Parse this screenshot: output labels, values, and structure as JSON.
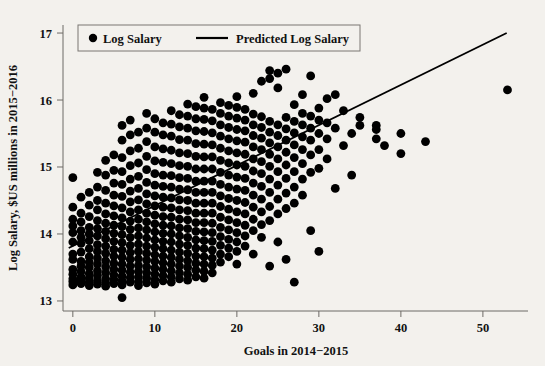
{
  "chart_data": {
    "type": "scatter",
    "title": "",
    "xlabel": "Goals in 2014−2015",
    "ylabel": "Log Salary, $US millions in 2015−2016",
    "xlim": [
      -1.2,
      55.5
    ],
    "ylim": [
      12.85,
      17.12
    ],
    "xticks": [
      0,
      10,
      20,
      30,
      40,
      50
    ],
    "xtick_labels": [
      "0",
      "10",
      "20",
      "30",
      "40",
      "50"
    ],
    "yticks": [
      13,
      14,
      15,
      16,
      17
    ],
    "ytick_labels": [
      "13",
      "14",
      "15",
      "16",
      "17"
    ],
    "grid": false,
    "legend_position": "top-left",
    "series": [
      {
        "name": "Log Salary",
        "type": "scatter",
        "marker": "circle",
        "color": "#000000",
        "marker_size": 4.4,
        "columns": [
          {
            "x": 0,
            "y": [
              13.24,
              13.29,
              13.33,
              13.4,
              13.47,
              13.62,
              13.7,
              13.88,
              14.02,
              14.12,
              14.22,
              14.4,
              14.84
            ]
          },
          {
            "x": 1,
            "y": [
              13.26,
              13.31,
              13.36,
              13.44,
              13.52,
              13.59,
              13.73,
              13.86,
              13.95,
              14.05,
              14.18,
              14.31,
              14.55
            ]
          },
          {
            "x": 2,
            "y": [
              13.23,
              13.28,
              13.34,
              13.41,
              13.5,
              13.58,
              13.66,
              13.78,
              13.9,
              14.0,
              14.1,
              14.26,
              14.43,
              14.62
            ]
          },
          {
            "x": 3,
            "y": [
              13.25,
              13.3,
              13.38,
              13.45,
              13.55,
              13.64,
              13.74,
              13.84,
              13.97,
              14.08,
              14.2,
              14.36,
              14.5,
              14.7,
              14.92
            ]
          },
          {
            "x": 4,
            "y": [
              13.22,
              13.27,
              13.33,
              13.42,
              13.51,
              13.6,
              13.71,
              13.82,
              13.93,
              14.04,
              14.16,
              14.3,
              14.46,
              14.65,
              14.88,
              15.1
            ]
          },
          {
            "x": 5,
            "y": [
              13.26,
              13.32,
              13.39,
              13.47,
              13.56,
              13.67,
              13.77,
              13.89,
              14.01,
              14.13,
              14.27,
              14.42,
              14.58,
              14.76,
              14.95,
              15.18
            ]
          },
          {
            "x": 6,
            "y": [
              13.05,
              13.24,
              13.3,
              13.37,
              13.46,
              13.55,
              13.65,
              13.76,
              13.87,
              13.99,
              14.11,
              14.24,
              14.39,
              14.56,
              14.74,
              14.93,
              15.14,
              15.4,
              15.62
            ]
          },
          {
            "x": 7,
            "y": [
              13.28,
              13.35,
              13.43,
              13.52,
              13.62,
              13.72,
              13.83,
              13.95,
              14.07,
              14.19,
              14.33,
              14.48,
              14.64,
              14.82,
              15.02,
              15.24,
              15.48,
              15.7
            ]
          },
          {
            "x": 8,
            "y": [
              13.23,
              13.29,
              13.36,
              13.44,
              13.53,
              13.63,
              13.74,
              13.85,
              13.97,
              14.09,
              14.22,
              14.36,
              14.51,
              14.68,
              14.86,
              15.06,
              15.28,
              15.52
            ]
          },
          {
            "x": 9,
            "y": [
              13.27,
              13.34,
              13.42,
              13.51,
              13.61,
              13.71,
              13.82,
              13.94,
              14.06,
              14.18,
              14.31,
              14.45,
              14.6,
              14.77,
              14.96,
              15.16,
              15.38,
              15.58,
              15.8
            ]
          },
          {
            "x": 10,
            "y": [
              13.25,
              13.32,
              13.4,
              13.49,
              13.59,
              13.69,
              13.8,
              13.91,
              14.03,
              14.15,
              14.28,
              14.42,
              14.57,
              14.73,
              14.9,
              15.09,
              15.3,
              15.52,
              15.72
            ]
          },
          {
            "x": 11,
            "y": [
              13.3,
              13.38,
              13.47,
              13.57,
              13.67,
              13.78,
              13.89,
              14.01,
              14.13,
              14.26,
              14.4,
              14.55,
              14.71,
              14.88,
              15.07,
              15.27,
              15.48,
              15.66
            ]
          },
          {
            "x": 12,
            "y": [
              13.28,
              13.36,
              13.45,
              13.55,
              13.65,
              13.76,
              13.88,
              14.0,
              14.12,
              14.25,
              14.39,
              14.54,
              14.7,
              14.87,
              15.05,
              15.25,
              15.46,
              15.64,
              15.84
            ]
          },
          {
            "x": 13,
            "y": [
              13.33,
              13.42,
              13.52,
              13.62,
              13.73,
              13.85,
              13.97,
              14.09,
              14.22,
              14.36,
              14.51,
              14.67,
              14.84,
              15.02,
              15.21,
              15.41,
              15.6,
              15.78
            ]
          },
          {
            "x": 14,
            "y": [
              13.31,
              13.4,
              13.5,
              13.6,
              13.71,
              13.83,
              13.95,
              14.08,
              14.21,
              14.35,
              14.5,
              14.66,
              14.83,
              15.01,
              15.2,
              15.4,
              15.58,
              15.76,
              15.94
            ]
          },
          {
            "x": 15,
            "y": [
              13.36,
              13.46,
              13.56,
              13.67,
              13.79,
              13.91,
              14.04,
              14.17,
              14.31,
              14.46,
              14.62,
              14.79,
              14.97,
              15.16,
              15.35,
              15.54,
              15.72,
              15.9
            ]
          },
          {
            "x": 16,
            "y": [
              13.34,
              13.44,
              13.55,
              13.66,
              13.78,
              13.9,
              14.03,
              14.17,
              14.31,
              14.46,
              14.62,
              14.79,
              14.97,
              15.15,
              15.34,
              15.53,
              15.71,
              15.88,
              16.04
            ]
          },
          {
            "x": 17,
            "y": [
              13.42,
              13.53,
              13.64,
              13.76,
              13.89,
              14.02,
              14.16,
              14.31,
              14.46,
              14.62,
              14.79,
              14.97,
              15.15,
              15.33,
              15.51,
              15.69,
              15.86
            ]
          },
          {
            "x": 18,
            "y": [
              13.58,
              13.7,
              13.83,
              13.96,
              14.1,
              14.25,
              14.41,
              14.57,
              14.74,
              14.92,
              15.1,
              15.28,
              15.46,
              15.63,
              15.8,
              15.96
            ]
          },
          {
            "x": 19,
            "y": [
              13.66,
              13.79,
              13.92,
              14.06,
              14.21,
              14.37,
              14.53,
              14.7,
              14.88,
              15.06,
              15.24,
              15.42,
              15.59,
              15.76,
              15.92
            ]
          },
          {
            "x": 20,
            "y": [
              13.55,
              13.74,
              13.88,
              14.02,
              14.17,
              14.33,
              14.5,
              14.67,
              14.85,
              15.03,
              15.21,
              15.39,
              15.56,
              15.73,
              15.89,
              16.05
            ]
          },
          {
            "x": 21,
            "y": [
              13.82,
              13.97,
              14.13,
              14.3,
              14.47,
              14.65,
              14.83,
              15.01,
              15.19,
              15.37,
              15.54,
              15.7,
              15.86
            ]
          },
          {
            "x": 22,
            "y": [
              13.7,
              14.05,
              14.22,
              14.4,
              14.58,
              14.76,
              14.94,
              15.12,
              15.3,
              15.47,
              15.63,
              15.79,
              16.1
            ]
          },
          {
            "x": 23,
            "y": [
              13.95,
              14.14,
              14.33,
              14.52,
              14.71,
              14.9,
              15.08,
              15.26,
              15.43,
              15.59,
              15.75,
              16.28
            ]
          },
          {
            "x": 24,
            "y": [
              13.52,
              14.2,
              14.41,
              14.62,
              14.82,
              15.01,
              15.19,
              15.36,
              15.52,
              15.68,
              16.32,
              16.44
            ]
          },
          {
            "x": 25,
            "y": [
              13.88,
              14.3,
              14.52,
              14.73,
              14.93,
              15.12,
              15.3,
              15.47,
              15.63,
              16.18,
              16.4
            ]
          },
          {
            "x": 26,
            "y": [
              13.62,
              14.38,
              14.61,
              14.83,
              15.03,
              15.22,
              15.4,
              15.57,
              15.74,
              16.46
            ]
          },
          {
            "x": 27,
            "y": [
              13.28,
              14.46,
              14.7,
              14.93,
              15.14,
              15.33,
              15.51,
              15.68,
              15.93
            ]
          },
          {
            "x": 28,
            "y": [
              14.58,
              14.82,
              15.05,
              15.26,
              15.45,
              15.63,
              15.8,
              16.08
            ]
          },
          {
            "x": 29,
            "y": [
              14.05,
              14.92,
              15.18,
              15.4,
              15.58,
              15.76,
              16.36
            ]
          },
          {
            "x": 30,
            "y": [
              13.74,
              14.98,
              15.26,
              15.5,
              15.7,
              15.88
            ]
          },
          {
            "x": 31,
            "y": [
              15.12,
              15.42,
              15.66,
              16.02
            ]
          },
          {
            "x": 32,
            "y": [
              14.68,
              15.58,
              16.08
            ]
          },
          {
            "x": 33,
            "y": [
              15.32,
              15.84
            ]
          },
          {
            "x": 34,
            "y": [
              14.88,
              15.5
            ]
          },
          {
            "x": 35,
            "y": [
              15.62,
              15.74
            ]
          },
          {
            "x": 37,
            "y": [
              15.42,
              15.56,
              15.62
            ]
          },
          {
            "x": 38,
            "y": [
              15.32
            ]
          },
          {
            "x": 40,
            "y": [
              15.2,
              15.5
            ]
          },
          {
            "x": 43,
            "y": [
              15.38
            ]
          },
          {
            "x": 53,
            "y": [
              16.15
            ]
          }
        ]
      },
      {
        "name": "Predicted Log Salary",
        "type": "line",
        "color": "#000000",
        "line": {
          "x_start": -0.5,
          "y_start": 13.79,
          "x_end": 52.9,
          "y_end": 17.0
        },
        "slope": 0.0601,
        "intercept": 13.82
      }
    ],
    "legend": [
      {
        "label": "Log Salary",
        "marker": "circle",
        "color": "#000000"
      },
      {
        "label": "Predicted Log Salary",
        "marker": "line",
        "color": "#000000"
      }
    ],
    "colors": {
      "background": "#f3f1ed",
      "point": "#000000",
      "line": "#000000",
      "axis": "#6d6a66",
      "text": "#111111"
    }
  },
  "geometry": {
    "plot_left": 63,
    "plot_right": 528,
    "plot_top": 25,
    "plot_bottom": 311,
    "legend_box": {
      "x": 78,
      "y": 25,
      "w": 282,
      "h": 26
    }
  }
}
